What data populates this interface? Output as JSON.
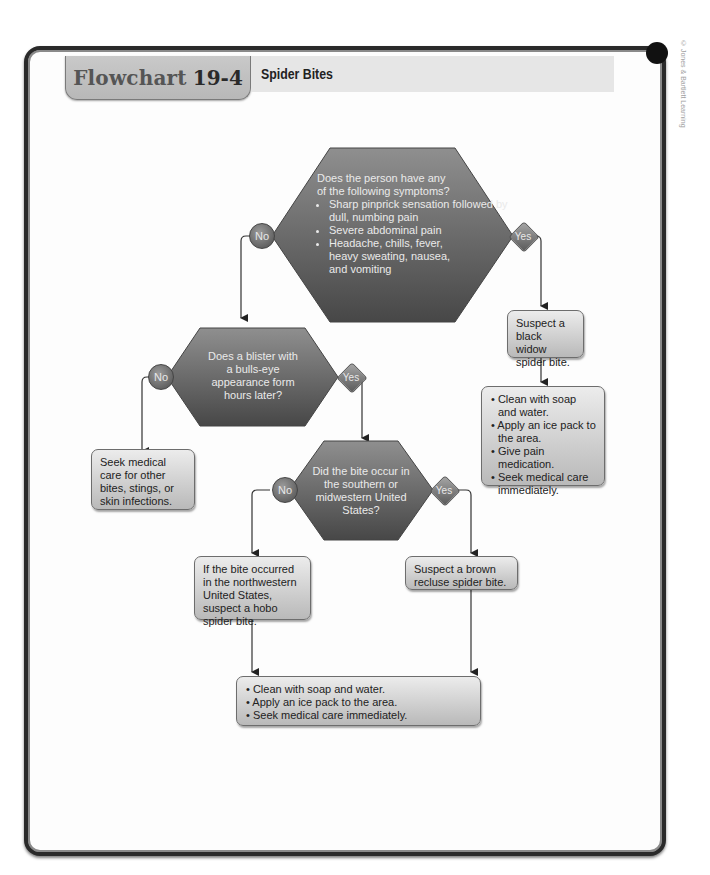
{
  "header": {
    "label": "Flowchart",
    "number": "19-4",
    "title": "Spider Bites"
  },
  "copyright": "© Jones & Bartlett Learning",
  "decision_labels": {
    "no": "No",
    "yes": "Yes"
  },
  "nodes": {
    "q1": {
      "intro": "Does the person have any of the following symptoms?",
      "bullets": [
        "Sharp pinprick sensation followed by dull, numbing pain",
        "Severe abdominal pain",
        "Headache, chills, fever, heavy sweating, nausea, and vomiting"
      ]
    },
    "black_widow": {
      "text": "Suspect a black widow spider bite."
    },
    "black_widow_actions": {
      "bullets": [
        "Clean with soap and water.",
        "Apply an ice pack to the area.",
        "Give pain medication.",
        "Seek medical care immediately."
      ]
    },
    "q2": {
      "text": "Does a blister with a bulls-eye appearance form hours later?"
    },
    "other_care": {
      "text": "Seek medical care for other bites, stings, or skin infections."
    },
    "q3": {
      "text": "Did the bite occur in the southern or midwestern United States?"
    },
    "hobo": {
      "text": "If the bite occurred in the northwestern United States, suspect a hobo spider bite."
    },
    "brown_recluse": {
      "text": "Suspect a brown recluse spider bite."
    },
    "final_actions": {
      "bullets": [
        "Clean with soap and water.",
        "Apply an ice pack to the area.",
        "Seek medical care immediately."
      ]
    }
  },
  "colors": {
    "hexagon_top": "#8a8a8a",
    "hexagon_bottom": "#4a4a4a",
    "box_top": "#ececec",
    "box_bottom": "#b9b9b9",
    "frame": "#2a2a2a",
    "tab": "#c4c4c4",
    "title_bar": "#e6e6e6"
  }
}
